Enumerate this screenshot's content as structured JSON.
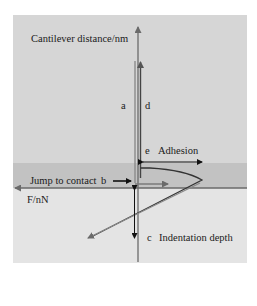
{
  "figure": {
    "type": "AFM force-distance curve schematic",
    "labels": {
      "y_axis": "Cantilever distance/nm",
      "x_axis": "F/nN",
      "a": "a",
      "d": "d",
      "e": "e",
      "adhesion": "Adhesion",
      "jump_to_contact": "Jump to contact",
      "b": "b",
      "c": "c",
      "indentation_depth": "Indentation depth"
    },
    "regions": [
      {
        "name": "non-contact",
        "color": "#d6d6d6"
      },
      {
        "name": "attractive-band",
        "color": "#c2c2c2"
      },
      {
        "name": "contact",
        "color": "#e4e4e4"
      }
    ],
    "colors": {
      "approach_curve": "#4a4a4a",
      "retract_curve": "#8a8a8a",
      "axis": "#6a6a6a",
      "arrows": "#111111"
    }
  }
}
